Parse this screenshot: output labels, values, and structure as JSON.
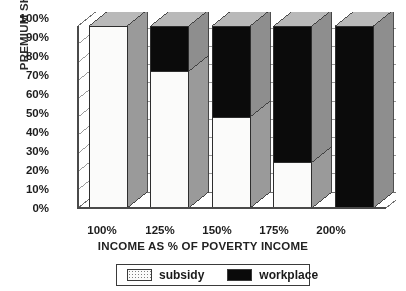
{
  "chart_data": {
    "type": "bar",
    "subtype": "stacked-100-3d",
    "title": "",
    "xlabel": "INCOME AS % OF POVERTY INCOME",
    "ylabel": "PREMIUM SHARE",
    "categories": [
      "100%",
      "125%",
      "150%",
      "175%",
      "200%"
    ],
    "series": [
      {
        "name": "subsidy",
        "color": "#fbfbfa",
        "values": [
          100,
          75,
          50,
          25,
          0
        ]
      },
      {
        "name": "workplace",
        "color": "#0a0a0a",
        "values": [
          0,
          25,
          50,
          75,
          100
        ]
      }
    ],
    "ylim": [
      0,
      100
    ],
    "yticks": [
      "0%",
      "10%",
      "20%",
      "30%",
      "40%",
      "50%",
      "60%",
      "70%",
      "80%",
      "90%",
      "100%"
    ],
    "ytick_values": [
      0,
      10,
      20,
      30,
      40,
      50,
      60,
      70,
      80,
      90,
      100
    ],
    "grid": true,
    "grid_axis": "y",
    "legend_position": "bottom"
  },
  "legend": {
    "items": [
      {
        "label": "subsidy",
        "swatch": "dotted-light-swatch"
      },
      {
        "label": "workplace",
        "swatch": "solid-black-swatch"
      }
    ]
  }
}
